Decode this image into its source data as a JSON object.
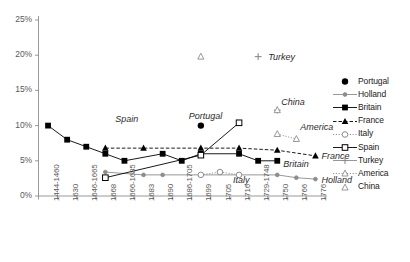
{
  "chart_data": {
    "type": "line",
    "title": "",
    "xlabel": "",
    "ylabel": "",
    "ylim": [
      0,
      25
    ],
    "yticks": [
      "0%",
      "5%",
      "10%",
      "15%",
      "20%",
      "25%"
    ],
    "ytick_values": [
      0,
      5,
      10,
      15,
      20,
      25
    ],
    "grid": false,
    "legend_position": "right",
    "categories": [
      "1444-1460",
      "1630",
      "1646-1665",
      "1668",
      "1666-1685",
      "1683",
      "1690",
      "1686-1705",
      "1699",
      "1705",
      "1716",
      "1729-1748",
      "1750",
      "1766",
      "1776"
    ],
    "series": [
      {
        "name": "Portugal",
        "marker": "filled-circle",
        "line": "none",
        "color": "#000000",
        "points": [
          {
            "x": "1699",
            "y": 10.0
          }
        ]
      },
      {
        "name": "Holland",
        "marker": "small-filled-circle",
        "line": "solid",
        "color": "#8c8c8c",
        "points": [
          {
            "x": "1668",
            "y": 3.4
          },
          {
            "x": "1683",
            "y": 3.0
          },
          {
            "x": "1690",
            "y": 3.0
          },
          {
            "x": "1750",
            "y": 3.0
          },
          {
            "x": "1766",
            "y": 2.6
          },
          {
            "x": "1776",
            "y": 2.4
          }
        ]
      },
      {
        "name": "Britain",
        "marker": "filled-square",
        "line": "solid",
        "color": "#000000",
        "points": [
          {
            "x": "1444-1460",
            "y": 10.0
          },
          {
            "x": "1630",
            "y": 8.0
          },
          {
            "x": "1646-1665",
            "y": 7.0
          },
          {
            "x": "1668",
            "y": 6.0
          },
          {
            "x": "1666-1685",
            "y": 5.0
          },
          {
            "x": "1690",
            "y": 6.0
          },
          {
            "x": "1686-1705",
            "y": 5.0
          },
          {
            "x": "1699",
            "y": 6.0
          },
          {
            "x": "1716",
            "y": 6.0
          },
          {
            "x": "1729-1748",
            "y": 5.0
          },
          {
            "x": "1750",
            "y": 5.0
          }
        ]
      },
      {
        "name": "France",
        "marker": "filled-triangle",
        "line": "dashed",
        "color": "#000000",
        "points": [
          {
            "x": "1668",
            "y": 6.8
          },
          {
            "x": "1683",
            "y": 6.8
          },
          {
            "x": "1699",
            "y": 6.8
          },
          {
            "x": "1716",
            "y": 6.8
          },
          {
            "x": "1750",
            "y": 6.5
          },
          {
            "x": "1776",
            "y": 5.7
          }
        ]
      },
      {
        "name": "Italy",
        "marker": "open-circle",
        "line": "dotted",
        "color": "#8c8c8c",
        "points": [
          {
            "x": "1699",
            "y": 3.0
          },
          {
            "x": "1705",
            "y": 3.4
          },
          {
            "x": "1716",
            "y": 3.0
          }
        ]
      },
      {
        "name": "Spain",
        "marker": "open-square",
        "line": "solid",
        "color": "#000000",
        "points": [
          {
            "x": "1668",
            "y": 2.6
          },
          {
            "x": "1699",
            "y": 5.8
          },
          {
            "x": "1716",
            "y": 10.4
          }
        ]
      },
      {
        "name": "Turkey",
        "marker": "plus",
        "line": "none",
        "color": "#8c8c8c",
        "points": [
          {
            "x": "1729-1748",
            "y": 19.8
          },
          {
            "x": "1750",
            "y": 12.2
          }
        ]
      },
      {
        "name": "America",
        "marker": "open-triangle",
        "line": "dotted",
        "color": "#8c8c8c",
        "points": [
          {
            "x": "1750",
            "y": 8.8
          },
          {
            "x": "1766",
            "y": 8.1
          }
        ]
      },
      {
        "name": "China",
        "marker": "open-triangle",
        "line": "none",
        "color": "#8c8c8c",
        "points": [
          {
            "x": "1699",
            "y": 19.8
          },
          {
            "x": "1750",
            "y": 12.2
          }
        ]
      }
    ],
    "annotations": [
      {
        "text": "Spain",
        "x": "1668",
        "y": 11.0
      },
      {
        "text": "Portugal",
        "x": "1699",
        "y": 11.2
      },
      {
        "text": "Turkey",
        "x": "1729-1748",
        "y": 19.8
      },
      {
        "text": "China",
        "x": "1750",
        "y": 13.3
      },
      {
        "text": "America",
        "x": "1766",
        "y": 9.8
      },
      {
        "text": "France",
        "x": "1776",
        "y": 5.7
      },
      {
        "text": "Britain",
        "x": "1750",
        "y": 4.6
      },
      {
        "text": "Italy",
        "x": "1716",
        "y": 2.3
      },
      {
        "text": "Holland",
        "x": "1776",
        "y": 2.3
      }
    ],
    "legend": [
      {
        "label": "Portugal",
        "marker": "filled-circle",
        "line": "none",
        "color": "#000000"
      },
      {
        "label": "Holland",
        "marker": "small-filled-circle",
        "line": "solid",
        "color": "#8c8c8c"
      },
      {
        "label": "Britain",
        "marker": "filled-square",
        "line": "solid",
        "color": "#000000"
      },
      {
        "label": "France",
        "marker": "filled-triangle",
        "line": "dashed",
        "color": "#000000"
      },
      {
        "label": "Italy",
        "marker": "open-circle",
        "line": "dotted",
        "color": "#8c8c8c"
      },
      {
        "label": "Spain",
        "marker": "open-square",
        "line": "solid",
        "color": "#000000"
      },
      {
        "label": "Turkey",
        "marker": "plus",
        "line": "solid",
        "color": "#8c8c8c"
      },
      {
        "label": "America",
        "marker": "open-triangle",
        "line": "dotted",
        "color": "#8c8c8c"
      },
      {
        "label": "China",
        "marker": "open-triangle",
        "line": "none",
        "color": "#8c8c8c"
      }
    ],
    "colors": {
      "axis": "#8c8c8c",
      "tick_text": "#595959",
      "dark_series": "#000000",
      "light_series": "#8c8c8c",
      "background": "#ffffff"
    }
  }
}
